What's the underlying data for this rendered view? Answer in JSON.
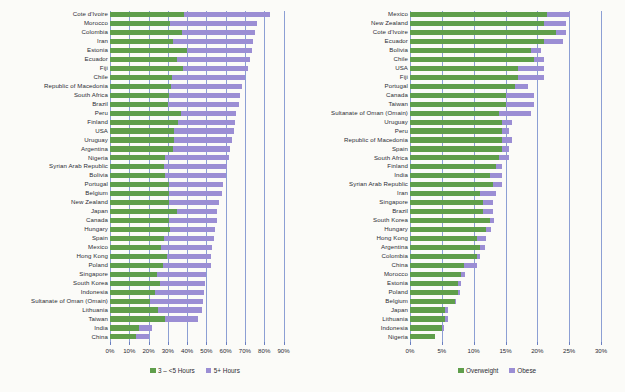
{
  "chart_data": [
    {
      "type": "bar",
      "id": "left",
      "title": "",
      "orientation": "horizontal",
      "stacked": true,
      "xlabel": "",
      "ylabel": "",
      "xlim": [
        0,
        90
      ],
      "xticks": [
        "0%",
        "10%",
        "20%",
        "30%",
        "40%",
        "50%",
        "60%",
        "70%",
        "80%",
        "90%"
      ],
      "xtick_values": [
        0,
        10,
        20,
        30,
        40,
        50,
        60,
        70,
        80,
        90
      ],
      "grid": true,
      "legend_position": "bottom",
      "legend": [
        {
          "name": "3 – <5 Hours",
          "color": "#5f9e4b"
        },
        {
          "name": "5+ Hours",
          "color": "#9b8ed4"
        }
      ],
      "categories": [
        "Cote d'Ivoire",
        "Morocco",
        "Colombia",
        "Iran",
        "Estonia",
        "Ecuador",
        "Fiji",
        "Chile",
        "Republic of Macedonia",
        "South Africa",
        "Brazil",
        "Peru",
        "Finland",
        "USA",
        "Uruguay",
        "Argentina",
        "Nigeria",
        "Syrian Arab Republic",
        "Bolivia",
        "Portugal",
        "Belgium",
        "New Zealand",
        "Japan",
        "Canada",
        "Hungary",
        "Spain",
        "Mexico",
        "Hong Kong",
        "Poland",
        "Singapore",
        "South Korea",
        "Indonesia",
        "Sultanate of Oman (Omain)",
        "Lithuania",
        "Taiwan",
        "India",
        "China"
      ],
      "series": [
        {
          "name": "3 – <5 Hours",
          "color": "#5f9e4b",
          "values": [
            38.5,
            31.0,
            37.5,
            32.5,
            40.0,
            35.0,
            38.0,
            32.0,
            31.5,
            30.5,
            30.0,
            37.0,
            35.5,
            33.0,
            33.0,
            32.5,
            28.5,
            28.0,
            28.5,
            30.5,
            30.5,
            30.5,
            35.0,
            30.5,
            31.0,
            28.0,
            26.5,
            29.5,
            27.5,
            24.5,
            26.0,
            23.5,
            21.0,
            25.0,
            28.5,
            15.0,
            13.5
          ]
        },
        {
          "name": "5+ Hours",
          "color": "#9b8ed4",
          "values": [
            44.5,
            45.5,
            37.5,
            41.5,
            33.5,
            37.5,
            33.5,
            38.0,
            37.0,
            37.0,
            37.0,
            28.5,
            29.5,
            31.5,
            30.5,
            30.0,
            33.0,
            32.5,
            31.5,
            28.0,
            27.5,
            26.0,
            20.5,
            25.0,
            23.5,
            26.0,
            26.5,
            23.0,
            25.0,
            25.5,
            23.5,
            25.5,
            27.0,
            22.5,
            17.0,
            7.0,
            6.5
          ]
        }
      ]
    },
    {
      "type": "bar",
      "id": "right",
      "title": "",
      "orientation": "horizontal",
      "stacked": true,
      "xlabel": "",
      "ylabel": "",
      "xlim": [
        0,
        30
      ],
      "xticks": [
        "0%",
        "5%",
        "10%",
        "15%",
        "20%",
        "25%",
        "30%"
      ],
      "xtick_values": [
        0,
        5,
        10,
        15,
        20,
        25,
        30
      ],
      "grid": true,
      "legend_position": "bottom",
      "legend": [
        {
          "name": "Overweight",
          "color": "#5f9e4b"
        },
        {
          "name": "Obese",
          "color": "#9b8ed4"
        }
      ],
      "categories": [
        "Mexico",
        "New Zealand",
        "Cote d'Ivoire",
        "Ecuador",
        "Bolivia",
        "Chile",
        "USA",
        "Fiji",
        "Portugal",
        "Canada",
        "Taiwan",
        "Sultanate of Oman (Omain)",
        "Uruguay",
        "Peru",
        "Republic of Macedonia",
        "Spain",
        "South Africa",
        "Finland",
        "India",
        "Syrian Arab Republic",
        "Iran",
        "Singapore",
        "Brazil",
        "South Korea",
        "Hungary",
        "Hong Kong",
        "Argentina",
        "Colombia",
        "China",
        "Morocco",
        "Estonia",
        "Poland",
        "Belgium",
        "Japan",
        "Lithuania",
        "Indonesia",
        "Nigeria"
      ],
      "series": [
        {
          "name": "Overweight",
          "color": "#5f9e4b",
          "values": [
            21.5,
            21.0,
            23.0,
            21.0,
            19.0,
            19.5,
            17.0,
            17.0,
            16.5,
            15.0,
            15.0,
            14.0,
            14.5,
            14.5,
            14.5,
            14.5,
            14.0,
            13.5,
            12.5,
            13.0,
            11.0,
            11.5,
            11.5,
            12.5,
            12.0,
            10.5,
            11.0,
            10.5,
            8.5,
            8.0,
            7.5,
            7.5,
            7.0,
            5.5,
            5.5,
            5.0,
            4.0
          ]
        },
        {
          "name": "Obese",
          "color": "#9b8ed4",
          "values": [
            3.6,
            3.5,
            1.5,
            3.0,
            1.5,
            1.5,
            4.0,
            4.0,
            2.0,
            4.5,
            4.5,
            5.0,
            1.5,
            1.0,
            1.5,
            1.0,
            1.5,
            1.0,
            2.0,
            1.5,
            2.5,
            1.5,
            1.5,
            0.7,
            0.8,
            1.5,
            0.8,
            0.5,
            2.0,
            0.6,
            0.5,
            0.3,
            0.3,
            0.5,
            0.4,
            0.3,
            0.0
          ]
        }
      ]
    }
  ]
}
